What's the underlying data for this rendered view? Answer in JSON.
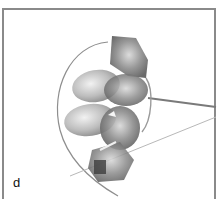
{
  "panel": {
    "label": "d",
    "border_color": "#8a8a8a",
    "subject": "crystal-gem-earring-photo"
  }
}
